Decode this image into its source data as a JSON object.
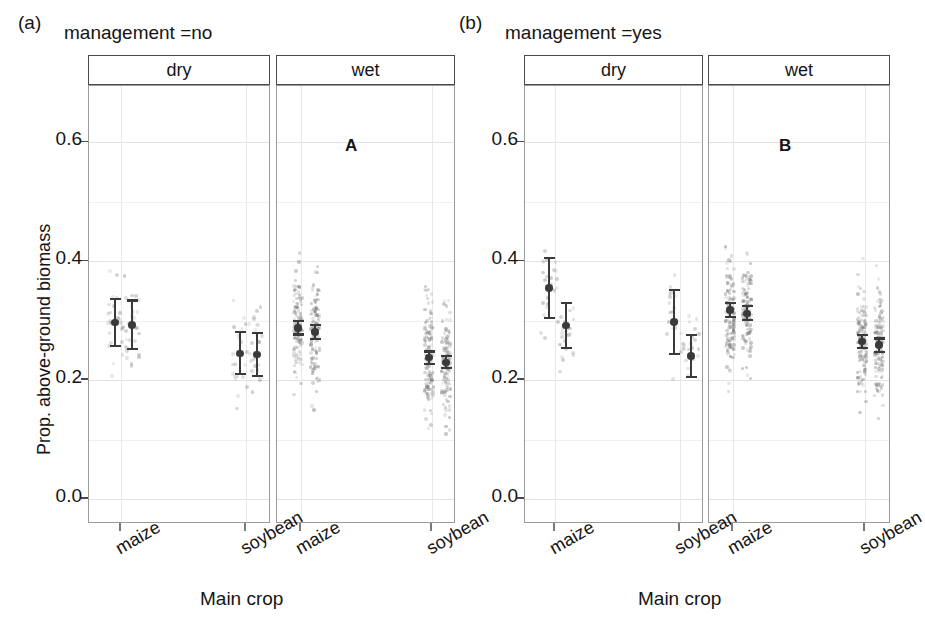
{
  "figure": {
    "xlabel": "Main crop",
    "ylabel": "Prop. above-ground biomass",
    "ytick_labels": [
      "0.6",
      "0.4",
      "0.2",
      "0.0"
    ],
    "xtick_labels": [
      "maize",
      "soybean"
    ]
  },
  "panels": [
    {
      "letter": "(a)",
      "title": "management =no",
      "annotation": "A",
      "facets": [
        {
          "label": "dry"
        },
        {
          "label": "wet"
        }
      ]
    },
    {
      "letter": "(b)",
      "title": "management =yes",
      "annotation": "B",
      "facets": [
        {
          "label": "dry"
        },
        {
          "label": "wet"
        }
      ]
    }
  ],
  "chart_data": {
    "type": "scatter",
    "xlabel": "Main crop",
    "ylabel": "Prop. above-ground biomass",
    "ylim": [
      -0.04,
      0.7
    ],
    "yticks": [
      0.0,
      0.2,
      0.4,
      0.6
    ],
    "ytick_labels": [
      "0.0",
      "0.2",
      "0.4",
      "0.6"
    ],
    "grid": true,
    "legend": "none",
    "categories": [
      "maize",
      "soybean"
    ],
    "facet_columns": [
      "management =no",
      "management =yes"
    ],
    "facet_rows": [
      "dry",
      "wet"
    ],
    "point_style": "jittered raw observations (light grey) with model mean and 95% CI (dark)",
    "groups": [
      {
        "panel": "(a) management =no",
        "facet": "dry",
        "crop": "maize",
        "annotation": "",
        "estimates": [
          {
            "series": 1,
            "mean": 0.297,
            "ci_low": 0.255,
            "ci_high": 0.338,
            "n_points": 26
          },
          {
            "series": 2,
            "mean": 0.293,
            "ci_low": 0.251,
            "ci_high": 0.336,
            "n_points": 26
          }
        ],
        "raw_range": [
          0.11,
          0.45
        ]
      },
      {
        "panel": "(a) management =no",
        "facet": "dry",
        "crop": "soybean",
        "annotation": "",
        "estimates": [
          {
            "series": 1,
            "mean": 0.245,
            "ci_low": 0.208,
            "ci_high": 0.283,
            "n_points": 22
          },
          {
            "series": 2,
            "mean": 0.243,
            "ci_low": 0.205,
            "ci_high": 0.281,
            "n_points": 22
          }
        ],
        "raw_range": [
          0.09,
          0.41
        ]
      },
      {
        "panel": "(a) management =no",
        "facet": "wet",
        "crop": "maize",
        "annotation": "A",
        "estimates": [
          {
            "series": 1,
            "mean": 0.288,
            "ci_low": 0.275,
            "ci_high": 0.301,
            "n_points": 120
          },
          {
            "series": 2,
            "mean": 0.281,
            "ci_low": 0.267,
            "ci_high": 0.295,
            "n_points": 120
          }
        ],
        "raw_range": [
          0.03,
          0.6
        ]
      },
      {
        "panel": "(a) management =no",
        "facet": "wet",
        "crop": "soybean",
        "annotation": "",
        "estimates": [
          {
            "series": 1,
            "mean": 0.238,
            "ci_low": 0.226,
            "ci_high": 0.25,
            "n_points": 120
          },
          {
            "series": 2,
            "mean": 0.23,
            "ci_low": 0.218,
            "ci_high": 0.243,
            "n_points": 120
          }
        ],
        "raw_range": [
          0.02,
          0.58
        ]
      },
      {
        "panel": "(b) management =yes",
        "facet": "dry",
        "crop": "maize",
        "annotation": "",
        "estimates": [
          {
            "series": 1,
            "mean": 0.355,
            "ci_low": 0.303,
            "ci_high": 0.408,
            "n_points": 24
          },
          {
            "series": 2,
            "mean": 0.292,
            "ci_low": 0.252,
            "ci_high": 0.332,
            "n_points": 24
          }
        ],
        "raw_range": [
          0.1,
          0.59
        ]
      },
      {
        "panel": "(b) management =yes",
        "facet": "dry",
        "crop": "soybean",
        "annotation": "",
        "estimates": [
          {
            "series": 1,
            "mean": 0.298,
            "ci_low": 0.242,
            "ci_high": 0.353,
            "n_points": 20
          },
          {
            "series": 2,
            "mean": 0.241,
            "ci_low": 0.204,
            "ci_high": 0.278,
            "n_points": 20
          }
        ],
        "raw_range": [
          0.11,
          0.61
        ]
      },
      {
        "panel": "(b) management =yes",
        "facet": "wet",
        "crop": "maize",
        "annotation": "B",
        "estimates": [
          {
            "series": 1,
            "mean": 0.318,
            "ci_low": 0.305,
            "ci_high": 0.332,
            "n_points": 125
          },
          {
            "series": 2,
            "mean": 0.312,
            "ci_low": 0.299,
            "ci_high": 0.326,
            "n_points": 125
          }
        ],
        "raw_range": [
          0.03,
          0.59
        ]
      },
      {
        "panel": "(b) management =yes",
        "facet": "wet",
        "crop": "soybean",
        "annotation": "",
        "estimates": [
          {
            "series": 1,
            "mean": 0.265,
            "ci_low": 0.252,
            "ci_high": 0.278,
            "n_points": 125
          },
          {
            "series": 2,
            "mean": 0.259,
            "ci_low": 0.246,
            "ci_high": 0.272,
            "n_points": 125
          }
        ],
        "raw_range": [
          0.01,
          0.6
        ]
      }
    ]
  }
}
